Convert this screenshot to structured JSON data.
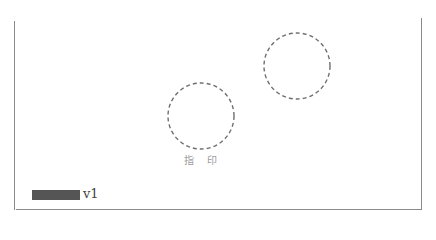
{
  "document": {
    "seal_label": "指 印",
    "version_label": "v1",
    "redacted": true
  },
  "shapes": {
    "circles": [
      {
        "name": "fingerprint-seal-circle",
        "cx": 201,
        "cy": 116,
        "r": 33
      },
      {
        "name": "seal-circle-right",
        "cx": 297,
        "cy": 66,
        "r": 33
      }
    ],
    "stroke_color": "#6e6e6e"
  }
}
